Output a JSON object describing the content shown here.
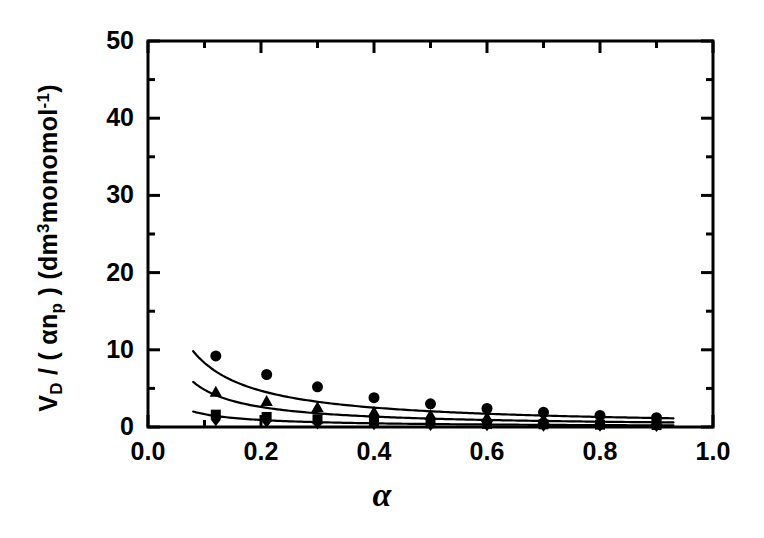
{
  "figure": {
    "background": "#ffffff",
    "ink": "#000000",
    "width": 764,
    "height": 538
  },
  "axes": {
    "frame": {
      "left": 148,
      "right": 713,
      "top": 41,
      "bottom": 427
    },
    "x_label": "α",
    "y_label_parts": {
      "v": "V",
      "v_sub": "D",
      "slash": " / ( ",
      "alpha": "α",
      "n": "n",
      "n_sub": "p",
      "close": " ) (dm",
      "cube": "3",
      "unit": "monomol",
      "exp": "-1",
      "tail": ")"
    },
    "y_label_plain": "V_D / ( αn_p ) (dm3monomol-1)",
    "xlim": [
      0.0,
      1.0
    ],
    "ylim": [
      0,
      50
    ],
    "xticks": [
      0.0,
      0.2,
      0.4,
      0.6,
      0.8,
      1.0
    ],
    "xtick_labels": [
      "0.0",
      "0.2",
      "0.4",
      "0.6",
      "0.8",
      "1.0"
    ],
    "xminor": [
      0.1,
      0.3,
      0.5,
      0.7,
      0.9
    ],
    "yticks": [
      0,
      10,
      20,
      30,
      40,
      50
    ],
    "ytick_labels": [
      "0",
      "10",
      "20",
      "30",
      "40",
      "50"
    ],
    "yminor": [
      5,
      15,
      25,
      35,
      45
    ],
    "grid": false,
    "legend": "none",
    "frame_linewidth": 3
  },
  "chart_data": {
    "type": "scatter",
    "title": "",
    "subtitle": "",
    "xlabel": "α",
    "ylabel": "V_D / ( αn_p ) (dm3monomol-1)",
    "xlim": [
      0.0,
      1.0
    ],
    "ylim": [
      0,
      50
    ],
    "xticks": [
      0.0,
      0.2,
      0.4,
      0.6,
      0.8,
      1.0
    ],
    "yticks": [
      0,
      10,
      20,
      30,
      40,
      50
    ],
    "grid": false,
    "legend_position": "none",
    "series": [
      {
        "name": "series-circle",
        "marker": "circle",
        "marker_size": 11,
        "color": "#000000",
        "has_fit_curve": true,
        "x": [
          0.12,
          0.21,
          0.3,
          0.4,
          0.5,
          0.6,
          0.7,
          0.8,
          0.9
        ],
        "y": [
          9.2,
          6.8,
          5.2,
          3.8,
          3.0,
          2.4,
          1.9,
          1.5,
          1.2
        ],
        "curve": {
          "model": "reciprocal",
          "x_start": 0.08,
          "x_end": 0.93,
          "a": 1.08,
          "b": 0.03,
          "description": "y = a/(x+b)"
        }
      },
      {
        "name": "series-triangle",
        "marker": "triangle-up",
        "marker_size": 11,
        "color": "#000000",
        "has_fit_curve": true,
        "x": [
          0.12,
          0.21,
          0.3,
          0.4,
          0.5,
          0.6,
          0.7,
          0.8,
          0.9
        ],
        "y": [
          4.5,
          3.3,
          2.5,
          1.9,
          1.5,
          1.2,
          1.0,
          0.8,
          0.7
        ],
        "curve": {
          "model": "reciprocal",
          "x_start": 0.08,
          "x_end": 0.93,
          "a": 0.56,
          "b": 0.016,
          "description": "y = a/(x+b)"
        }
      },
      {
        "name": "series-square",
        "marker": "square",
        "marker_size": 10,
        "color": "#000000",
        "has_fit_curve": true,
        "x": [
          0.12,
          0.21,
          0.3,
          0.4,
          0.5,
          0.6,
          0.7,
          0.8,
          0.9
        ],
        "y": [
          1.6,
          1.3,
          1.0,
          0.7,
          0.5,
          0.4,
          0.35,
          0.3,
          0.25
        ],
        "curve": {
          "model": "reciprocal",
          "x_start": 0.08,
          "x_end": 0.93,
          "a": 0.2,
          "b": 0.02,
          "description": "y = a/(x+b)"
        }
      },
      {
        "name": "series-diamond",
        "marker": "diamond",
        "marker_size": 10,
        "color": "#000000",
        "has_fit_curve": false,
        "x": [
          0.12,
          0.21,
          0.3,
          0.4,
          0.5,
          0.6,
          0.7,
          0.8,
          0.9
        ],
        "y": [
          0.9,
          0.7,
          0.5,
          0.4,
          0.3,
          0.25,
          0.2,
          0.18,
          0.15
        ],
        "curve": null
      }
    ]
  }
}
